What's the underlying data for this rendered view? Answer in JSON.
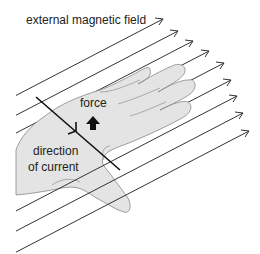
{
  "diagram": {
    "labels": {
      "field": "external magnetic field",
      "force": "force",
      "current_line1": "direction",
      "current_line2": "of current"
    },
    "field_line_count": 9,
    "colors": {
      "background": "#ffffff",
      "hand_fill": "#e4e4e4",
      "hand_outline": "#888888",
      "lines": "#333333",
      "wire": "#111111",
      "force_arrow": "#111111",
      "text": "#222222"
    }
  }
}
